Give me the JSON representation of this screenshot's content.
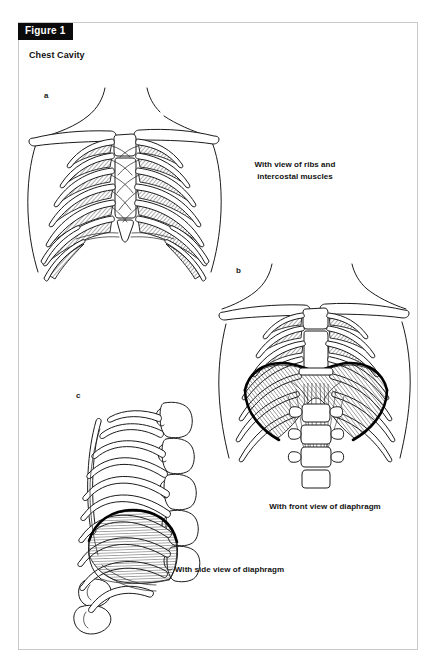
{
  "figure": {
    "tag": "Figure 1",
    "title": "Chest Cavity"
  },
  "panels": [
    {
      "letter": "a",
      "caption": "With view of ribs and\nintercostal muscles",
      "caption_line1": "With view of ribs and",
      "caption_line2": "intercostal muscles",
      "view": "anterior chest, ribs and intercostal muscles"
    },
    {
      "letter": "b",
      "caption": "With front view of diaphragm",
      "caption_line1": "With front view of diaphragm",
      "caption_line2": "",
      "view": "anterior chest, diaphragm dome and crura"
    },
    {
      "letter": "c",
      "caption": "With side view of diaphragm",
      "caption_line1": "With side view of diaphragm",
      "caption_line2": "",
      "view": "lateral chest, diaphragm dome"
    }
  ],
  "colors": {
    "tag_background": "#0b0b0b",
    "tag_text": "#ffffff",
    "line": "#1b1b1b",
    "diaphragm_edge": "#000000",
    "page_border": "#c9c9c9",
    "page_background": "#ffffff"
  }
}
